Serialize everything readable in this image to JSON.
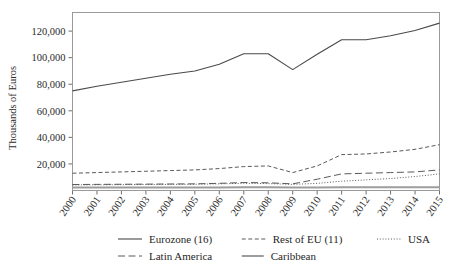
{
  "chart_data": {
    "type": "line",
    "title": "",
    "xlabel": "",
    "ylabel": "Thousands of Euros",
    "grid": false,
    "legend_position": "bottom",
    "x": [
      2000,
      2001,
      2002,
      2003,
      2004,
      2005,
      2006,
      2007,
      2008,
      2009,
      2010,
      2011,
      2012,
      2013,
      2014,
      2015
    ],
    "xtick_labels": [
      "2000",
      "2001",
      "2002",
      "2003",
      "2004",
      "2005",
      "2006",
      "2007",
      "2008",
      "2009",
      "2010",
      "2011",
      "2012",
      "2013",
      "2014",
      "2015"
    ],
    "ytick_labels": [
      "20,000",
      "40,000",
      "60,000",
      "80,000",
      "100,000",
      "120,000"
    ],
    "yticks": [
      20000,
      40000,
      60000,
      80000,
      100000,
      120000
    ],
    "ylim": [
      0,
      134000
    ],
    "xlim": [
      2000,
      2015
    ],
    "series": [
      {
        "name": "Eurozone (16)",
        "style": "solid",
        "color": "#4a4a4a",
        "width": 1.1,
        "values": [
          75000,
          78500,
          81500,
          84500,
          87500,
          90000,
          95000,
          103000,
          103000,
          91000,
          102500,
          113500,
          113500,
          116500,
          120500,
          126000
        ]
      },
      {
        "name": "Rest of EU (11)",
        "style": "dashed",
        "color": "#5a5a5a",
        "width": 1.0,
        "values": [
          13000,
          13500,
          14000,
          14500,
          15000,
          15500,
          16500,
          18000,
          18500,
          13500,
          18500,
          27000,
          27500,
          29000,
          31000,
          34500
        ]
      },
      {
        "name": "USA",
        "style": "dotted",
        "color": "#5a5a5a",
        "width": 1.0,
        "values": [
          4200,
          4300,
          4400,
          4500,
          4600,
          4700,
          5000,
          5400,
          5200,
          4600,
          5400,
          7000,
          8000,
          9000,
          10500,
          12500
        ]
      },
      {
        "name": "Latin America",
        "style": "longdash",
        "color": "#5a5a5a",
        "width": 1.0,
        "values": [
          4500,
          4600,
          4700,
          4800,
          4900,
          5000,
          5400,
          6000,
          5800,
          5000,
          8500,
          12500,
          13000,
          13500,
          14000,
          15500
        ]
      },
      {
        "name": "Caribbean",
        "style": "solid-thick",
        "color": "#9d9d9d",
        "width": 2.0,
        "values": [
          2200,
          2200,
          2200,
          2200,
          2200,
          2200,
          2300,
          2400,
          2400,
          2200,
          2300,
          2400,
          2400,
          2400,
          2500,
          2500
        ]
      }
    ]
  },
  "legend": {
    "row1": [
      {
        "label": "Eurozone (16)",
        "series_index": 0
      },
      {
        "label": "Rest of EU (11)",
        "series_index": 1
      },
      {
        "label": "USA",
        "series_index": 2
      }
    ],
    "row2": [
      {
        "label": "Latin America",
        "series_index": 3
      },
      {
        "label": "Caribbean",
        "series_index": 4
      }
    ]
  }
}
